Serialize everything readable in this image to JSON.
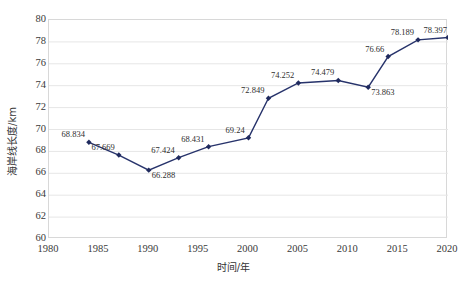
{
  "chart_data": {
    "type": "line",
    "title": "",
    "subtitle": "",
    "xlabel": "时间/年",
    "ylabel": "海岸线长度/km",
    "xlim": [
      1980,
      2020
    ],
    "ylim": [
      60,
      80
    ],
    "xticks": [
      1980,
      1985,
      1990,
      1995,
      2000,
      2005,
      2010,
      2015,
      2020
    ],
    "yticks": [
      60,
      62,
      64,
      66,
      68,
      70,
      72,
      74,
      76,
      78,
      80
    ],
    "grid": "horizontal",
    "legend": "none",
    "series": [
      {
        "name": "海岸线长度",
        "color": "#27336b",
        "marker": "diamond",
        "x": [
          1984,
          1987,
          1990,
          1993,
          1996,
          2000,
          2002,
          2005,
          2009,
          2012,
          2014,
          2017,
          2020
        ],
        "values": [
          68.834,
          67.669,
          66.288,
          67.424,
          68.431,
          69.24,
          72.849,
          74.252,
          74.479,
          73.863,
          76.66,
          78.189,
          78.397
        ],
        "point_labels": [
          "68.834",
          "67.669",
          "66.288",
          "67.424",
          "68.431",
          "69.24",
          "72.849",
          "74.252",
          "74.479",
          "73.863",
          "76.66",
          "78.189",
          "78.397"
        ]
      }
    ],
    "colors": {
      "line": "#27336b",
      "marker": "#1f2a5e",
      "grid": "#e6e6e6",
      "axis": "#d8d8d8",
      "text": "#2e2e2e"
    }
  }
}
